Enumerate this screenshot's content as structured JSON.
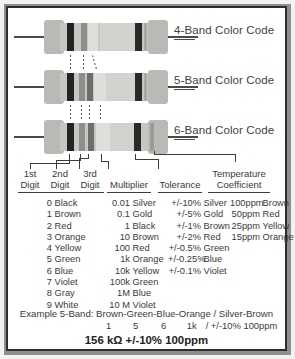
{
  "diagram": {
    "resistors": [
      {
        "label": "4-Band Color Code",
        "name": "resistor-4-band",
        "bands": [
          "Black",
          "Gray",
          "Black"
        ]
      },
      {
        "label": "5-Band Color Code",
        "name": "resistor-5-band",
        "bands": [
          "Black",
          "Gray",
          "White",
          "Black"
        ]
      },
      {
        "label": "6-Band Color Code",
        "name": "resistor-6-band",
        "bands": [
          "Black",
          "Gray",
          "White",
          "Black",
          "Light Gray"
        ]
      }
    ],
    "callouts": [
      {
        "line1": "1st",
        "line2": "Digit"
      },
      {
        "line1": "2nd",
        "line2": "Digit"
      },
      {
        "line1": "3rd",
        "line2": "Digit"
      },
      {
        "line1": "",
        "line2": "Multiplier"
      },
      {
        "line1": "",
        "line2": "Tolerance"
      },
      {
        "line1": "Temperature",
        "line2": "Coefficient"
      }
    ]
  },
  "table": {
    "headers": [
      "1st Digit",
      "2nd Digit",
      "3rd Digit",
      "Multiplier",
      "Tolerance",
      "Temperature Coefficient"
    ],
    "digits": [
      {
        "value": "0",
        "color": "Black"
      },
      {
        "value": "1",
        "color": "Brown"
      },
      {
        "value": "2",
        "color": "Red"
      },
      {
        "value": "3",
        "color": "Orange"
      },
      {
        "value": "4",
        "color": "Yellow"
      },
      {
        "value": "5",
        "color": "Green"
      },
      {
        "value": "6",
        "color": "Blue"
      },
      {
        "value": "7",
        "color": "Violet"
      },
      {
        "value": "8",
        "color": "Gray"
      },
      {
        "value": "9",
        "color": "White"
      }
    ],
    "multipliers": [
      {
        "value": "0.01",
        "color": "Silver"
      },
      {
        "value": "0.1",
        "color": "Gold"
      },
      {
        "value": "1",
        "color": "Black"
      },
      {
        "value": "10",
        "color": "Brown"
      },
      {
        "value": "100",
        "color": "Red"
      },
      {
        "value": "1k",
        "color": "Orange"
      },
      {
        "value": "10k",
        "color": "Yellow"
      },
      {
        "value": "100k",
        "color": "Green"
      },
      {
        "value": "1M",
        "color": "Blue"
      },
      {
        "value": "10 M",
        "color": "Violet"
      }
    ],
    "tolerances": [
      {
        "value": "+/-10%",
        "color": "Silver"
      },
      {
        "value": "+/-5%",
        "color": "Gold"
      },
      {
        "value": "+/-1%",
        "color": "Brown"
      },
      {
        "value": "+/-2%",
        "color": "Red"
      },
      {
        "value": "+/-0.5%",
        "color": "Green"
      },
      {
        "value": "+/-0.25%",
        "color": "Blue"
      },
      {
        "value": "+/-0.1%",
        "color": "Violet"
      }
    ],
    "tempcoefs": [
      {
        "value": "100ppm",
        "color": "Brown"
      },
      {
        "value": "50ppm",
        "color": "Red"
      },
      {
        "value": "25ppm",
        "color": "Yellow"
      },
      {
        "value": "15ppm",
        "color": "Orange"
      }
    ]
  },
  "example": {
    "line1": "Example 5-Band: Brown-Green-Blue-Orange / Silver-Brown",
    "values": [
      "1",
      "5",
      "6",
      "1k",
      "/ +/-10% 100ppm"
    ],
    "result": "156 kΩ  +/-10% 100ppm"
  },
  "colors": {
    "frame": "#2e2e2e",
    "body": "#c6c6c2",
    "cap": "#b9b9b5",
    "band_dark": "#232323",
    "text": "#3a3a3a"
  }
}
